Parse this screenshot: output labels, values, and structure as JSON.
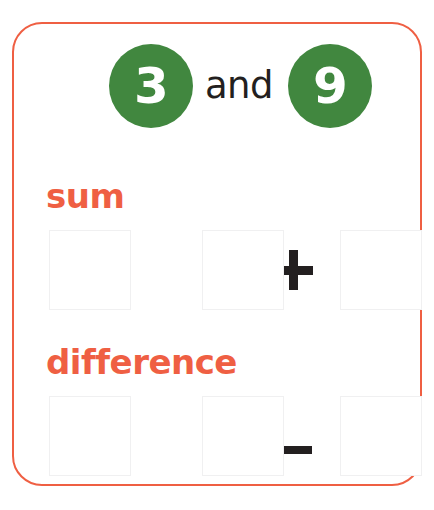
{
  "worksheet": {
    "frame_color": "#ef5f43",
    "accent_color": "#ef5f43",
    "circle_color": "#41873f",
    "text_color": "#231f20",
    "box_border_color": "#f0f0f1",
    "numbers": {
      "first": "3",
      "second": "9",
      "conjunction": "and"
    },
    "sections": [
      {
        "label": "sum",
        "operator": "+",
        "equals": "=",
        "operand_a": "",
        "operand_b": "",
        "result": ""
      },
      {
        "label": "difference",
        "operator": "–",
        "equals": "=",
        "operand_a": "",
        "operand_b": "",
        "result": ""
      }
    ]
  }
}
